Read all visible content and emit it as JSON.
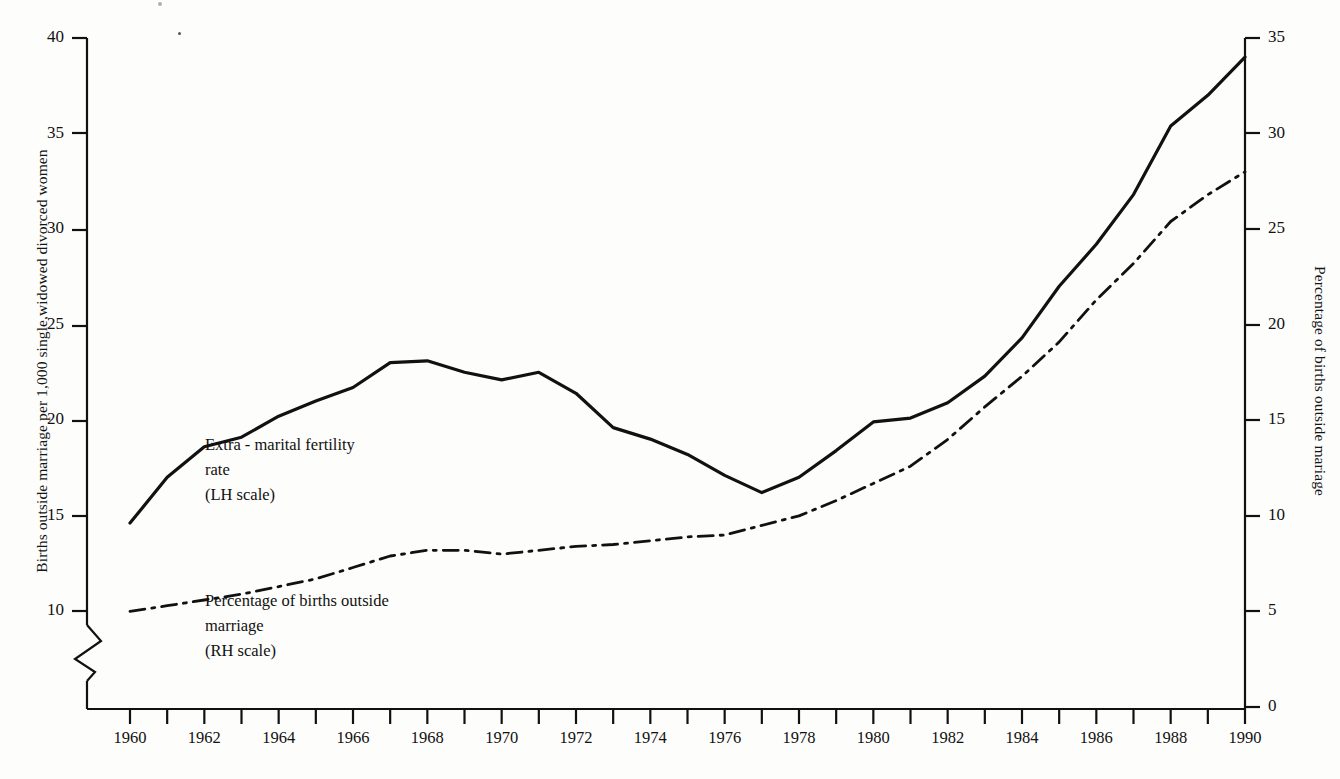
{
  "figure": {
    "background_color": "#fdfdfb",
    "ink_color": "#111111"
  },
  "axes": {
    "left": {
      "title": "Births outside marriage per 1,000 single,widowed divorced women",
      "ticks": [
        "40",
        "35",
        "30",
        "25",
        "20",
        "15",
        "10"
      ],
      "has_break": true
    },
    "right": {
      "title": "Percentage of births outside mariage",
      "ticks": [
        "35",
        "30",
        "25",
        "20",
        "15",
        "10",
        "5",
        "0"
      ]
    },
    "bottom": {
      "ticks": [
        "1960",
        "1962",
        "1964",
        "1966",
        "1968",
        "1970",
        "1972",
        "1974",
        "1976",
        "1978",
        "1980",
        "1982",
        "1984",
        "1986",
        "1988",
        "1990"
      ]
    }
  },
  "annotations": [
    {
      "name": "extra-marital-fertility-label",
      "lines": [
        "Extra - marital fertility",
        "rate",
        "(LH scale)"
      ],
      "x": 205,
      "y": 432
    },
    {
      "name": "percentage-births-outside-marriage-label",
      "lines": [
        "Percentage of births outside",
        "marriage",
        "(RH scale)"
      ],
      "x": 205,
      "y": 588
    }
  ],
  "chart_data": {
    "type": "line",
    "title": "",
    "xlabel": "",
    "ylabel": "Births outside marriage per 1,000 single,widowed divorced women",
    "y2label": "Percentage of births outside mariage",
    "x": [
      1960,
      1961,
      1962,
      1963,
      1964,
      1965,
      1966,
      1967,
      1968,
      1969,
      1970,
      1971,
      1972,
      1973,
      1974,
      1975,
      1976,
      1977,
      1978,
      1979,
      1980,
      1981,
      1982,
      1983,
      1984,
      1985,
      1986,
      1987,
      1988,
      1989,
      1990
    ],
    "xlim": [
      1959.5,
      1990.5
    ],
    "ylim": [
      9.0,
      40.0
    ],
    "y2lim": [
      0,
      35
    ],
    "grid": false,
    "legend": "inline-annotations",
    "series": [
      {
        "name": "Extra - marital fertility rate (LH scale)",
        "axis": "left",
        "style": "solid",
        "values": [
          14.6,
          17.0,
          18.6,
          19.1,
          20.2,
          21.0,
          21.7,
          23.0,
          23.1,
          22.5,
          22.1,
          22.5,
          21.4,
          19.6,
          19.0,
          18.2,
          17.1,
          16.2,
          17.0,
          18.4,
          19.9,
          20.1,
          20.9,
          22.3,
          24.3,
          27.0,
          29.2,
          31.8,
          35.4,
          37.0,
          39.0
        ]
      },
      {
        "name": "Percentage of births outside marriage (RH scale)",
        "axis": "right",
        "style": "dash-dot",
        "values": [
          5.0,
          5.3,
          5.6,
          5.9,
          6.3,
          6.7,
          7.3,
          7.9,
          8.2,
          8.2,
          8.0,
          8.2,
          8.4,
          8.5,
          8.7,
          8.9,
          9.0,
          9.5,
          10.0,
          10.8,
          11.7,
          12.6,
          14.0,
          15.7,
          17.3,
          19.1,
          21.3,
          23.2,
          25.4,
          26.8,
          28.0
        ]
      }
    ]
  }
}
